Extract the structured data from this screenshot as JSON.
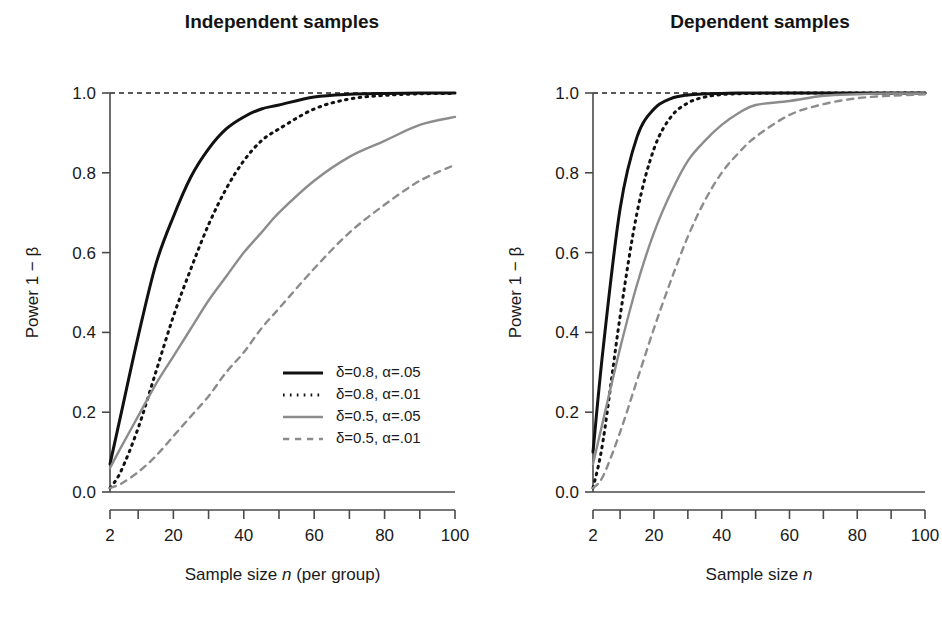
{
  "figure": {
    "background": "#ffffff",
    "width": 942,
    "height": 618
  },
  "panels": [
    {
      "id": "independent",
      "title": "Independent samples",
      "xlabel_pre": "Sample size ",
      "xlabel_it": "n",
      "xlabel_post": " (per group)",
      "ylabel": "Power 1 − β"
    },
    {
      "id": "dependent",
      "title": "Dependent samples",
      "xlabel_pre": "Sample size ",
      "xlabel_it": "n",
      "xlabel_post": "",
      "ylabel": "Power 1 − β"
    }
  ],
  "legend": {
    "position": "bottom-right-of-left-panel",
    "items": [
      {
        "label": "δ=0.8, α=.05",
        "color": "#111111",
        "style": "solid",
        "width": 3.0
      },
      {
        "label": "δ=0.8, α=.01",
        "color": "#111111",
        "style": "dotted",
        "width": 3.0
      },
      {
        "label": "δ=0.5, α=.05",
        "color": "#8c8c8c",
        "style": "solid",
        "width": 2.4
      },
      {
        "label": "δ=0.5, α=.01",
        "color": "#8c8c8c",
        "style": "dashed",
        "width": 2.4
      }
    ]
  },
  "chart_data": {
    "type": "line",
    "panel_titles": [
      "Independent samples",
      "Dependent samples"
    ],
    "xlabel": "Sample size n",
    "ylabel": "Power 1 − β",
    "xlim": [
      2,
      100
    ],
    "ylim": [
      0.0,
      1.0
    ],
    "xticks": [
      2,
      10,
      20,
      30,
      40,
      50,
      60,
      70,
      80,
      90,
      100
    ],
    "xticklabels": [
      "2",
      "",
      "20",
      "",
      "40",
      "",
      "60",
      "",
      "80",
      "",
      "100"
    ],
    "yticks": [
      0.0,
      0.2,
      0.4,
      0.6,
      0.8,
      1.0
    ],
    "yticklabels": [
      "0.0",
      "0.2",
      "0.4",
      "0.6",
      "0.8",
      "1.0"
    ],
    "grid": false,
    "reference_line": {
      "y": 1.0,
      "style": "dashed",
      "color": "#222222"
    },
    "legend_position": "lower right (left panel only)",
    "x": [
      2,
      5,
      10,
      15,
      20,
      25,
      30,
      35,
      40,
      45,
      50,
      60,
      70,
      80,
      90,
      100
    ],
    "panels": [
      {
        "name": "Independent samples",
        "series": [
          {
            "name": "δ=0.8, α=.05",
            "delta": 0.8,
            "alpha": 0.05,
            "color": "#111111",
            "style": "solid",
            "values": [
              0.07,
              0.19,
              0.39,
              0.57,
              0.69,
              0.79,
              0.86,
              0.91,
              0.94,
              0.96,
              0.97,
              0.99,
              0.997,
              0.999,
              1.0,
              1.0
            ]
          },
          {
            "name": "δ=0.8, α=.01",
            "delta": 0.8,
            "alpha": 0.01,
            "color": "#111111",
            "style": "dotted",
            "values": [
              0.01,
              0.05,
              0.16,
              0.3,
              0.44,
              0.56,
              0.67,
              0.76,
              0.83,
              0.88,
              0.91,
              0.96,
              0.985,
              0.994,
              0.998,
              0.999
            ]
          },
          {
            "name": "δ=0.5, α=.05",
            "delta": 0.5,
            "alpha": 0.05,
            "color": "#8c8c8c",
            "style": "solid",
            "values": [
              0.06,
              0.11,
              0.19,
              0.27,
              0.34,
              0.41,
              0.48,
              0.54,
              0.6,
              0.65,
              0.7,
              0.78,
              0.84,
              0.88,
              0.92,
              0.94
            ]
          },
          {
            "name": "δ=0.5, α=.01",
            "delta": 0.5,
            "alpha": 0.01,
            "color": "#8c8c8c",
            "style": "dashed",
            "values": [
              0.01,
              0.02,
              0.05,
              0.09,
              0.14,
              0.19,
              0.24,
              0.3,
              0.35,
              0.41,
              0.46,
              0.56,
              0.65,
              0.72,
              0.78,
              0.82
            ]
          }
        ]
      },
      {
        "name": "Dependent samples",
        "series": [
          {
            "name": "δ=0.8, α=.05",
            "delta": 0.8,
            "alpha": 0.05,
            "color": "#111111",
            "style": "solid",
            "values": [
              0.1,
              0.36,
              0.71,
              0.89,
              0.96,
              0.986,
              0.995,
              0.998,
              0.999,
              1.0,
              1.0,
              1.0,
              1.0,
              1.0,
              1.0,
              1.0
            ]
          },
          {
            "name": "δ=0.8, α=.01",
            "delta": 0.8,
            "alpha": 0.01,
            "color": "#111111",
            "style": "dotted",
            "values": [
              0.01,
              0.13,
              0.44,
              0.7,
              0.86,
              0.94,
              0.975,
              0.99,
              0.996,
              0.998,
              0.999,
              1.0,
              1.0,
              1.0,
              1.0,
              1.0
            ]
          },
          {
            "name": "δ=0.5, α=.05",
            "delta": 0.5,
            "alpha": 0.05,
            "color": "#8c8c8c",
            "style": "solid",
            "values": [
              0.07,
              0.18,
              0.36,
              0.52,
              0.65,
              0.75,
              0.83,
              0.88,
              0.92,
              0.95,
              0.97,
              0.98,
              0.993,
              0.997,
              0.999,
              0.999
            ]
          },
          {
            "name": "δ=0.5, α=.01",
            "delta": 0.5,
            "alpha": 0.01,
            "color": "#8c8c8c",
            "style": "dashed",
            "values": [
              0.01,
              0.04,
              0.15,
              0.28,
              0.41,
              0.53,
              0.64,
              0.73,
              0.8,
              0.85,
              0.89,
              0.945,
              0.972,
              0.987,
              0.993,
              0.997
            ]
          }
        ]
      }
    ]
  }
}
